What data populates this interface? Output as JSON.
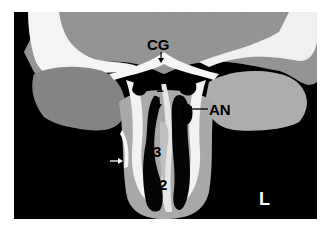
{
  "image": {
    "type": "coronal CT scan of paranasal sinuses",
    "background_color": "#ffffff",
    "frame_color": "#000000"
  },
  "labels": {
    "cg": "CG",
    "one": "1",
    "an": "AN",
    "three": "3",
    "two": "2",
    "side": "L"
  },
  "arrows": [
    {
      "name": "cg-arrow",
      "direction": "down",
      "color": "#000000"
    },
    {
      "name": "one-arrow",
      "direction": "down",
      "color": "#000000"
    },
    {
      "name": "an-arrow",
      "direction": "left",
      "color": "#000000"
    },
    {
      "name": "small-white-arrow",
      "direction": "right",
      "color": "#ffffff"
    }
  ]
}
